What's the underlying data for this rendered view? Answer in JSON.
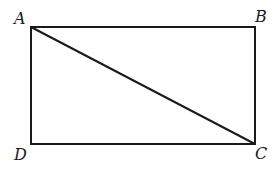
{
  "diagram": {
    "type": "rectangle-with-diagonal",
    "stroke_color": "#1a1a1a",
    "background": "#ffffff",
    "vertices": [
      {
        "label": "A",
        "x": 31,
        "y": 27,
        "position": "top-left"
      },
      {
        "label": "B",
        "x": 255,
        "y": 27,
        "position": "top-right"
      },
      {
        "label": "C",
        "x": 255,
        "y": 144,
        "position": "bottom-right"
      },
      {
        "label": "D",
        "x": 31,
        "y": 144,
        "position": "bottom-left"
      }
    ],
    "edges": [
      {
        "from": "A",
        "to": "B"
      },
      {
        "from": "B",
        "to": "C"
      },
      {
        "from": "C",
        "to": "D"
      },
      {
        "from": "D",
        "to": "A"
      }
    ],
    "diagonals": [
      {
        "from": "A",
        "to": "C"
      }
    ],
    "labels": {
      "A": "A",
      "B": "B",
      "C": "C",
      "D": "D"
    }
  }
}
